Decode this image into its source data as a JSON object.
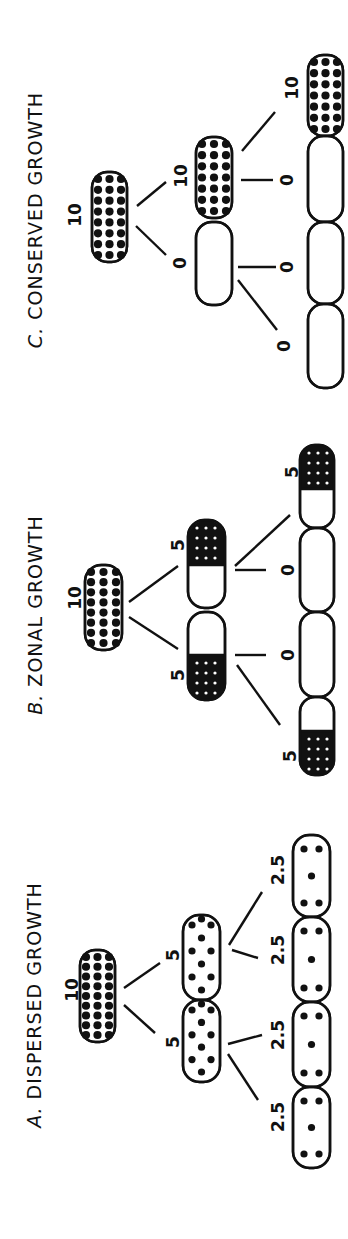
{
  "figure": {
    "orientation": "rotated 90deg counter-clockwise",
    "ink_color": "#111111",
    "background": "#ffffff"
  },
  "panels": [
    {
      "id": "C",
      "letter": "C.",
      "title": "CONSERVED GROWTH",
      "title_pos": {
        "x": 35,
        "y_top": 45,
        "y_bottom": 395
      },
      "root": {
        "label": "10",
        "label_pos": [
          75,
          215
        ],
        "cell": {
          "x": 92,
          "y": 172,
          "w": 35,
          "h": 90,
          "fill": "full"
        }
      },
      "gen1": [
        {
          "label": "10",
          "label_pos": [
            181,
            176
          ],
          "link": [
            137,
            206,
            166,
            182
          ],
          "cell": {
            "x": 196,
            "y": 137,
            "w": 36,
            "h": 81,
            "fill": "full"
          }
        },
        {
          "label": "0",
          "label_pos": [
            180,
            263
          ],
          "link": [
            136,
            226,
            166,
            255
          ],
          "cell": {
            "x": 196,
            "y": 222,
            "w": 36,
            "h": 83,
            "fill": "none"
          }
        }
      ],
      "gen2": [
        {
          "label": "10",
          "label_pos": [
            292,
            88
          ],
          "link": [
            242,
            151,
            275,
            112
          ],
          "cell": {
            "x": 308,
            "y": 55,
            "w": 35,
            "h": 81,
            "fill": "full"
          }
        },
        {
          "label": "0",
          "label_pos": [
            287,
            180
          ],
          "link": [
            241,
            180,
            273,
            180
          ],
          "cell": {
            "x": 308,
            "y": 136,
            "w": 35,
            "h": 86,
            "fill": "none"
          }
        },
        {
          "label": "0",
          "label_pos": [
            287,
            267
          ],
          "link": [
            238,
            267,
            276,
            267
          ],
          "cell": {
            "x": 308,
            "y": 222,
            "w": 35,
            "h": 82,
            "fill": "none"
          }
        },
        {
          "label": "0",
          "label_pos": [
            284,
            346
          ],
          "link": [
            238,
            280,
            277,
            330
          ],
          "cell": {
            "x": 308,
            "y": 304,
            "w": 35,
            "h": 84,
            "fill": "none"
          }
        }
      ]
    },
    {
      "id": "B",
      "letter": "B.",
      "title": "ZONAL GROWTH",
      "title_pos": {
        "x": 35,
        "y_top": 485,
        "y_bottom": 745
      },
      "root": {
        "label": "10",
        "label_pos": [
          75,
          598
        ],
        "cell": {
          "x": 85,
          "y": 565,
          "w": 37,
          "h": 85,
          "fill": "full"
        }
      },
      "gen1": [
        {
          "label": "5",
          "label_pos": [
            178,
            545
          ],
          "link": [
            129,
            602,
            178,
            566
          ],
          "cell": {
            "x": 188,
            "y": 520,
            "w": 37,
            "h": 88,
            "fill": "top",
            "fill_extent": 45
          }
        },
        {
          "label": "5",
          "label_pos": [
            178,
            675
          ],
          "link": [
            129,
            617,
            178,
            649
          ],
          "cell": {
            "x": 188,
            "y": 612,
            "w": 37,
            "h": 88,
            "fill": "bottom",
            "fill_extent": 45
          }
        }
      ],
      "gen2": [
        {
          "label": "5",
          "label_pos": [
            292,
            472
          ],
          "link": [
            235,
            566,
            290,
            515
          ],
          "cell": {
            "x": 300,
            "y": 445,
            "w": 34,
            "h": 83,
            "fill": "top",
            "fill_extent": 44
          }
        },
        {
          "label": "0",
          "label_pos": [
            288,
            570
          ],
          "link": [
            235,
            570,
            266,
            570
          ],
          "cell": {
            "x": 300,
            "y": 528,
            "w": 34,
            "h": 84,
            "fill": "none"
          }
        },
        {
          "label": "0",
          "label_pos": [
            288,
            655
          ],
          "link": [
            235,
            655,
            266,
            655
          ],
          "cell": {
            "x": 300,
            "y": 612,
            "w": 34,
            "h": 85,
            "fill": "none"
          }
        },
        {
          "label": "5",
          "label_pos": [
            290,
            756
          ],
          "link": [
            237,
            665,
            280,
            725
          ],
          "cell": {
            "x": 300,
            "y": 697,
            "w": 34,
            "h": 78,
            "fill": "bottom",
            "fill_extent": 44
          }
        }
      ]
    },
    {
      "id": "A",
      "letter": "A.",
      "title": "DISPERSED GROWTH",
      "title_pos": {
        "x": 34,
        "y_top": 845,
        "y_bottom": 1165
      },
      "root": {
        "label": "10",
        "label_pos": [
          72,
          990
        ],
        "cell": {
          "x": 80,
          "y": 950,
          "w": 35,
          "h": 92,
          "fill": "full"
        }
      },
      "gen1": [
        {
          "label": "5",
          "label_pos": [
            173,
            955
          ],
          "link": [
            124,
            988,
            160,
            963
          ],
          "cell": {
            "x": 183,
            "y": 915,
            "w": 37,
            "h": 85,
            "fill": "dispersed",
            "dots": 12
          }
        },
        {
          "label": "5",
          "label_pos": [
            173,
            1042
          ],
          "link": [
            124,
            1005,
            155,
            1033
          ],
          "cell": {
            "x": 183,
            "y": 1000,
            "w": 37,
            "h": 82,
            "fill": "dispersed",
            "dots": 12
          }
        }
      ],
      "gen2": [
        {
          "label": "2.5",
          "label_pos": [
            278,
            870
          ],
          "link": [
            229,
            945,
            262,
            892
          ],
          "cell": {
            "x": 293,
            "y": 835,
            "w": 37,
            "h": 82,
            "fill": "sparse",
            "dots": 5
          }
        },
        {
          "label": "2.5",
          "label_pos": [
            278,
            950
          ],
          "link": [
            232,
            950,
            258,
            958
          ],
          "cell": {
            "x": 293,
            "y": 917,
            "w": 37,
            "h": 85,
            "fill": "sparse",
            "dots": 5
          }
        },
        {
          "label": "2.5",
          "label_pos": [
            278,
            1035
          ],
          "link": [
            228,
            1044,
            262,
            1035
          ],
          "cell": {
            "x": 293,
            "y": 1002,
            "w": 37,
            "h": 85,
            "fill": "sparse",
            "dots": 5
          }
        },
        {
          "label": "2.5",
          "label_pos": [
            278,
            1117
          ],
          "link": [
            228,
            1054,
            258,
            1100
          ],
          "cell": {
            "x": 293,
            "y": 1087,
            "w": 37,
            "h": 81,
            "fill": "sparse",
            "dots": 5
          }
        }
      ]
    }
  ]
}
